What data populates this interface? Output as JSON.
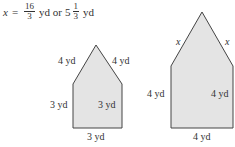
{
  "equation": {
    "var": "x",
    "eq": "=",
    "frac1_num": "16",
    "frac1_den": "3",
    "unit1": "yd or",
    "whole": "5",
    "frac2_num": "1",
    "frac2_den": "3",
    "unit2": "yd"
  },
  "small_shape": {
    "fill": "#e4e4e4",
    "labels": {
      "upper_left": "4 yd",
      "upper_right": "4 yd",
      "left": "3 yd",
      "right": "3 yd",
      "bottom": "3 yd"
    }
  },
  "large_shape": {
    "fill": "#e4e4e4",
    "labels": {
      "upper_left": "x",
      "upper_right": "x",
      "left": "4 yd",
      "right": "4 yd",
      "bottom": "4 yd"
    }
  }
}
